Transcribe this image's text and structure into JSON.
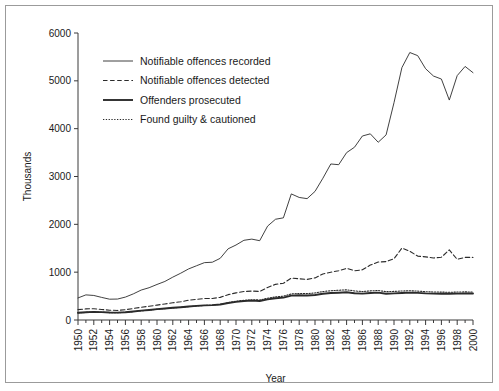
{
  "figure": {
    "background": "#ffffff",
    "frame_color": "#9b9b9b",
    "line_color": "#2b2b2b"
  },
  "axes": {
    "y_title": "Thousands",
    "x_title": "Year",
    "y_ticks": [
      "0",
      "1000",
      "2000",
      "3000",
      "4000",
      "5000",
      "6000"
    ],
    "x_ticks": [
      "1950",
      "1952",
      "1954",
      "1956",
      "1958",
      "1960",
      "1962",
      "1964",
      "1966",
      "1968",
      "1970",
      "1972",
      "1974",
      "1976",
      "1978",
      "1980",
      "1982",
      "1984",
      "1986",
      "1988",
      "1990",
      "1992",
      "1994",
      "1996",
      "1998",
      "2000"
    ]
  },
  "legend": {
    "items": [
      {
        "label": "Notifiable offences recorded",
        "style": "solid-thin"
      },
      {
        "label": "Notifiable offences detected",
        "style": "dashed"
      },
      {
        "label": "Offenders prosecuted",
        "style": "solid-thick"
      },
      {
        "label": "Found guilty & cautioned",
        "style": "dotted"
      }
    ]
  },
  "chart_data": {
    "type": "line",
    "title": "",
    "subtitle": "",
    "xlabel": "Year",
    "ylabel": "Thousands",
    "xlim": [
      1950,
      2000
    ],
    "ylim": [
      0,
      6000
    ],
    "grid": false,
    "legend_position": "upper-left-inside",
    "x": [
      1950,
      1951,
      1952,
      1953,
      1954,
      1955,
      1956,
      1957,
      1958,
      1959,
      1960,
      1961,
      1962,
      1963,
      1964,
      1965,
      1966,
      1967,
      1968,
      1969,
      1970,
      1971,
      1972,
      1973,
      1974,
      1975,
      1976,
      1977,
      1978,
      1979,
      1980,
      1981,
      1982,
      1983,
      1984,
      1985,
      1986,
      1987,
      1988,
      1989,
      1990,
      1991,
      1992,
      1993,
      1994,
      1995,
      1996,
      1997,
      1998,
      1999,
      2000
    ],
    "series": [
      {
        "name": "Notifiable offences recorded",
        "style": "solid-thin",
        "values": [
          461,
          525,
          513,
          472,
          435,
          438,
          479,
          546,
          626,
          675,
          743,
          806,
          896,
          978,
          1068,
          1134,
          1199,
          1208,
          1289,
          1488,
          1568,
          1666,
          1691,
          1658,
          1963,
          2106,
          2136,
          2636,
          2562,
          2537,
          2688,
          2964,
          3262,
          3247,
          3499,
          3612,
          3847,
          3892,
          3716,
          3870,
          4544,
          5276,
          5592,
          5527,
          5253,
          5100,
          5037,
          4598,
          5109,
          5301,
          5171
        ]
      },
      {
        "name": "Notifiable offences detected",
        "style": "dashed",
        "values": [
          216,
          232,
          236,
          221,
          205,
          200,
          215,
          240,
          267,
          287,
          311,
          336,
          360,
          381,
          414,
          430,
          448,
          450,
          473,
          530,
          567,
          595,
          605,
          596,
          680,
          745,
          768,
          875,
          862,
          848,
          880,
          962,
          1000,
          1030,
          1080,
          1030,
          1049,
          1148,
          1211,
          1220,
          1280,
          1504,
          1436,
          1336,
          1320,
          1297,
          1313,
          1465,
          1268,
          1310,
          1308
        ]
      },
      {
        "name": "Offenders prosecuted",
        "style": "solid-thick",
        "values": [
          152,
          162,
          170,
          165,
          158,
          155,
          163,
          178,
          196,
          210,
          227,
          241,
          256,
          268,
          283,
          295,
          306,
          311,
          323,
          355,
          380,
          398,
          405,
          398,
          430,
          455,
          468,
          510,
          516,
          513,
          524,
          548,
          563,
          571,
          580,
          560,
          552,
          566,
          573,
          550,
          556,
          565,
          572,
          567,
          556,
          551,
          549,
          548,
          552,
          556,
          553
        ]
      },
      {
        "name": "Found guilty & cautioned",
        "style": "dotted",
        "values": [
          148,
          158,
          166,
          161,
          155,
          152,
          160,
          175,
          192,
          206,
          223,
          237,
          252,
          264,
          279,
          292,
          304,
          310,
          325,
          362,
          392,
          412,
          424,
          419,
          455,
          483,
          498,
          545,
          554,
          552,
          566,
          594,
          612,
          622,
          631,
          608,
          594,
          609,
          617,
          592,
          598,
          606,
          612,
          604,
          592,
          586,
          583,
          580,
          584,
          588,
          584
        ]
      }
    ]
  }
}
